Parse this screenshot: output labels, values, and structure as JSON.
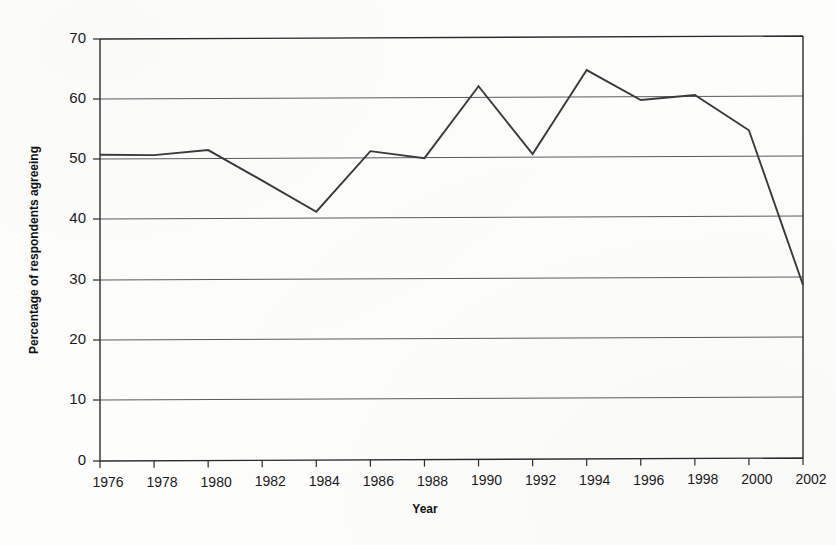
{
  "chart_data": {
    "type": "line",
    "title": "",
    "subtitle": "",
    "xlabel": "Year",
    "ylabel": "Percentage of respondents agreeing",
    "x": [
      1976,
      1978,
      1980,
      1982,
      1984,
      1986,
      1988,
      1990,
      1992,
      1994,
      1996,
      1998,
      2000,
      2002
    ],
    "values": [
      50.8,
      50.7,
      51.5,
      46.4,
      41.2,
      51.2,
      50.0,
      61.9,
      50.6,
      64.5,
      59.5,
      60.3,
      54.4,
      28.7
    ],
    "series": [
      {
        "name": "Percentage of respondents agreeing",
        "values": [
          50.8,
          50.7,
          51.5,
          46.4,
          41.2,
          51.2,
          50.0,
          61.9,
          50.6,
          64.5,
          59.5,
          60.3,
          54.4,
          28.7
        ],
        "color": "#3a3a3a"
      }
    ],
    "x_tick_labels": [
      "1976",
      "1978",
      "1980",
      "1982",
      "1984",
      "1986",
      "1988",
      "1990",
      "1992",
      "1994",
      "1996",
      "1998",
      "2000",
      "2002"
    ],
    "y_tick_labels": [
      "0",
      "10",
      "20",
      "30",
      "40",
      "50",
      "60",
      "70"
    ],
    "y_ticks": [
      0,
      10,
      20,
      30,
      40,
      50,
      60,
      70
    ],
    "ylim": [
      0,
      70
    ],
    "xlim": [
      1976,
      2002
    ],
    "grid": true,
    "grid_axis": "y",
    "legend": false,
    "legend_position": "none",
    "markers": false,
    "annotations": [],
    "note_interpolated_points": [
      1982
    ]
  },
  "colors": {
    "background": "#fdfdfc",
    "line": "#3a3a3a",
    "grid": "#5a5a5a",
    "axis": "#2b2b2b",
    "text": "#1a1a1a"
  }
}
